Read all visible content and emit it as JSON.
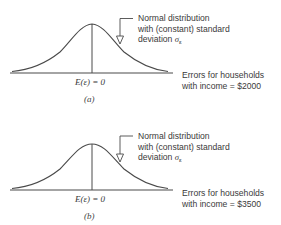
{
  "panels": [
    {
      "id": "a",
      "panel_label": "(a)",
      "annotation": {
        "line1": "Normal distribution",
        "line2": "with (constant) standard",
        "line3_prefix": "deviation ",
        "sigma": "σ",
        "sigma_sub": "ε"
      },
      "axis_label": {
        "line1": "Errors for households",
        "line2": "with income = $2000"
      },
      "mean_label": "E(ε) = 0"
    },
    {
      "id": "b",
      "panel_label": "(b)",
      "annotation": {
        "line1": "Normal distribution",
        "line2": "with (constant) standard",
        "line3_prefix": "deviation ",
        "sigma": "σ",
        "sigma_sub": "ε"
      },
      "axis_label": {
        "line1": "Errors for households",
        "line2": "with income = $3500"
      },
      "mean_label": "E(ε) = 0"
    }
  ],
  "colors": {
    "line": "#4a4a4a",
    "text": "#3a3a3a",
    "background": "#ffffff"
  }
}
